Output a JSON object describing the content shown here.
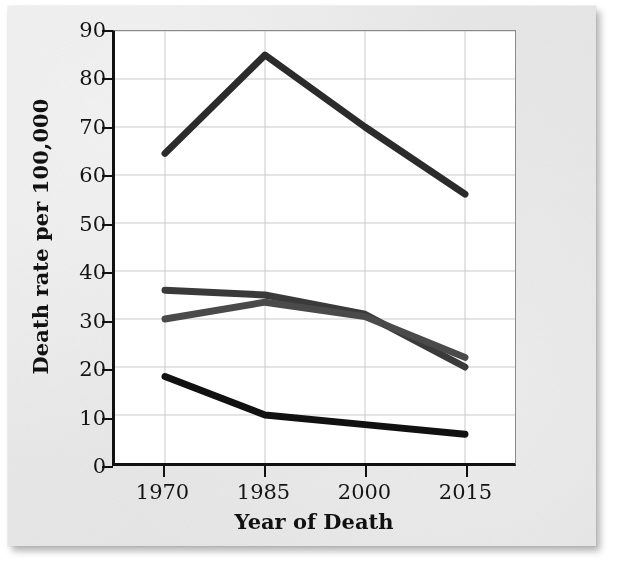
{
  "chart_data": {
    "type": "line",
    "title": "",
    "xlabel": "Year of Death",
    "ylabel": "Death rate per 100,000",
    "categories": [
      "1970",
      "1985",
      "2000",
      "2015"
    ],
    "x": [
      1970,
      1985,
      2000,
      2015
    ],
    "ylim": [
      0,
      90
    ],
    "yticks": [
      0,
      10,
      20,
      30,
      40,
      50,
      60,
      70,
      80,
      90
    ],
    "ytick_labels": [
      "0",
      "10",
      "20",
      "30",
      "40",
      "50",
      "60",
      "70",
      "80",
      "90"
    ],
    "xlim": [
      1970,
      2015
    ],
    "grid": true,
    "grid_color": "#c9c9c9",
    "legend": "none",
    "plot_background": "#ffffff",
    "series": [
      {
        "name": "series-1",
        "color": "#2b2b2b",
        "line_width": 7,
        "values": [
          64.5,
          85,
          70,
          56
        ]
      },
      {
        "name": "series-2",
        "color": "#3a3a3a",
        "line_width": 7,
        "values": [
          36,
          35,
          31,
          20
        ]
      },
      {
        "name": "series-3",
        "color": "#4a4a4a",
        "line_width": 7,
        "values": [
          30,
          33.5,
          30.5,
          22
        ]
      },
      {
        "name": "series-4",
        "color": "#111111",
        "line_width": 7,
        "values": [
          18,
          10,
          8,
          6
        ]
      }
    ]
  },
  "figure": {
    "page_background": "#e9e9e9",
    "axis_color": "#111111",
    "text_color": "#141414"
  }
}
